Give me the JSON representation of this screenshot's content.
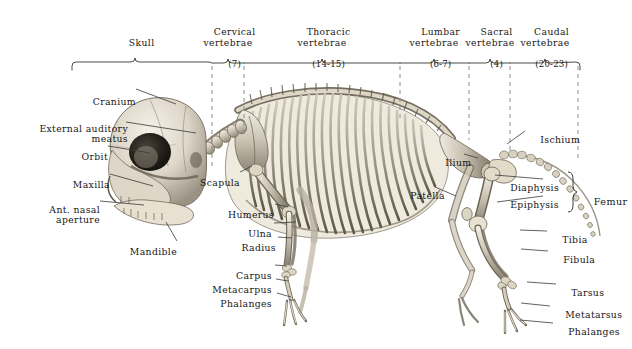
{
  "figure": {
    "background_color": "#ffffff",
    "ink_color": "#1b1b1b",
    "bone_light": "#e9e4d9",
    "bone_mid": "#b9b1a2",
    "bone_dark": "#6d6658"
  },
  "regions": [
    {
      "name": "Skull",
      "label": "Skull",
      "count": "",
      "center_x": 135,
      "start_x": 72,
      "end_x": 212
    },
    {
      "name": "Cervical",
      "label": "Cervical\nvertebrae",
      "count": "(7)",
      "center_x": 228,
      "start_x": 212,
      "end_x": 244
    },
    {
      "name": "Thoracic",
      "label": "Thoracic\nvertebrae",
      "count": "(14-15)",
      "center_x": 322,
      "start_x": 244,
      "end_x": 400
    },
    {
      "name": "Lumbar",
      "label": "Lumbar\nvertebrae",
      "count": "(6-7)",
      "center_x": 434,
      "start_x": 400,
      "end_x": 469
    },
    {
      "name": "Sacral",
      "label": "Sacral\nvertebrae",
      "count": "(4)",
      "center_x": 490,
      "start_x": 469,
      "end_x": 510
    },
    {
      "name": "Caudal",
      "label": "Caudal\nvertebrae",
      "count": "(20-23)",
      "center_x": 545,
      "start_x": 510,
      "end_x": 580
    }
  ],
  "divider_lines_x": [
    212,
    244,
    400,
    469,
    510,
    578
  ],
  "callouts_left": [
    {
      "id": "cranium",
      "text": "Cranium",
      "x": 132,
      "y": 91,
      "tip_x": 176,
      "tip_y": 104
    },
    {
      "id": "external-auditory-meatus",
      "text": "External auditory\nmeatus",
      "x": 118,
      "y": 118,
      "tip_x": 196,
      "tip_y": 133
    },
    {
      "id": "orbit",
      "text": "Orbit",
      "x": 101,
      "y": 144,
      "tip_x": 150,
      "tip_y": 153
    },
    {
      "id": "maxilla",
      "text": "Maxilla",
      "x": 103,
      "y": 171,
      "tip_x": 153,
      "tip_y": 186
    },
    {
      "id": "ant-nasal-aperture",
      "text": "Ant. nasal\naperture",
      "x": 95,
      "y": 197,
      "tip_x": 144,
      "tip_y": 205
    },
    {
      "id": "mandible",
      "text": "Mandible",
      "x": 178,
      "y": 243,
      "tip_x": 165,
      "tip_y": 222
    }
  ],
  "callouts_mid": [
    {
      "id": "scapula",
      "text": "Scapula",
      "x": 233,
      "y": 176,
      "tip_x": 252,
      "tip_y": 166
    },
    {
      "id": "humerus",
      "text": "Humerus",
      "x": 244,
      "y": 201,
      "tip_x": 288,
      "tip_y": 206
    },
    {
      "id": "ulna",
      "text": "Ulna",
      "x": 255,
      "y": 221,
      "tip_x": 296,
      "tip_y": 222
    },
    {
      "id": "radius",
      "text": "Radius",
      "x": 255,
      "y": 235,
      "tip_x": 292,
      "tip_y": 237
    },
    {
      "id": "carpus",
      "text": "Carpus",
      "x": 248,
      "y": 263,
      "tip_x": 287,
      "tip_y": 266
    },
    {
      "id": "metacarpus",
      "text": "Metacarpus",
      "x": 238,
      "y": 277,
      "tip_x": 288,
      "tip_y": 281
    },
    {
      "id": "phalanges-fore",
      "text": "Phalanges",
      "x": 243,
      "y": 291,
      "tip_x": 291,
      "tip_y": 296
    }
  ],
  "callouts_right": [
    {
      "id": "ischium",
      "text": "Ischium",
      "x": 527,
      "y": 127,
      "tip_x": 507,
      "tip_y": 144
    },
    {
      "id": "ilium",
      "text": "Ilium",
      "x": 446,
      "y": 152,
      "tip_x": 478,
      "tip_y": 158
    },
    {
      "id": "patella",
      "text": "Patella",
      "x": 415,
      "y": 183,
      "tip_x": 456,
      "tip_y": 196
    },
    {
      "id": "diaphysis",
      "text": "Diaphysis",
      "x": 545,
      "y": 177,
      "tip_x": 495,
      "tip_y": 175
    },
    {
      "id": "epiphysis",
      "text": "Epiphysis",
      "x": 545,
      "y": 193,
      "tip_x": 497,
      "tip_y": 201
    },
    {
      "id": "tibia",
      "text": "Tibia",
      "x": 549,
      "y": 228,
      "tip_x": 520,
      "tip_y": 229
    },
    {
      "id": "fibula",
      "text": "Fibula",
      "x": 550,
      "y": 248,
      "tip_x": 521,
      "tip_y": 248
    },
    {
      "id": "tarsus",
      "text": "Tarsus",
      "x": 558,
      "y": 281,
      "tip_x": 527,
      "tip_y": 281
    },
    {
      "id": "metatarsus",
      "text": "Metatarsus",
      "x": 552,
      "y": 303,
      "tip_x": 521,
      "tip_y": 302
    },
    {
      "id": "phalanges-hind",
      "text": "Phalanges",
      "x": 555,
      "y": 320,
      "tip_x": 520,
      "tip_y": 319
    }
  ],
  "brace_group": {
    "label": "Femur",
    "members": [
      "Diaphysis",
      "Epiphysis"
    ],
    "label_x": 578,
    "label_y": 192
  }
}
